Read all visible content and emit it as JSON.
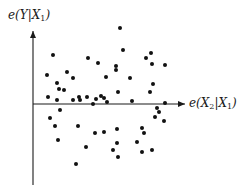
{
  "chart_data": {
    "type": "scatter",
    "title": "",
    "xlabel": "e(X2|X1)",
    "ylabel": "e(Y|X1)",
    "xlabel_parts": {
      "pre": "e(X",
      "sub1": "2",
      "mid": "|X",
      "sub2": "1",
      "post": ")"
    },
    "ylabel_parts": {
      "pre": "e(Y|X",
      "sub1": "1",
      "post": ")"
    },
    "grid": false,
    "ticks": false,
    "legend": null,
    "axes": {
      "origin_px": [
        33,
        104
      ],
      "y_axis_top_px": 30,
      "y_axis_bottom_px": 185,
      "x_axis_right_px": 183,
      "color": "#1a1a1a"
    },
    "point_color": "#111111",
    "point_radius": 2,
    "points_px": [
      [
        53,
        55
      ],
      [
        120,
        28
      ],
      [
        123,
        50
      ],
      [
        47,
        75
      ],
      [
        88,
        58
      ],
      [
        98,
        63
      ],
      [
        67,
        72
      ],
      [
        73,
        78
      ],
      [
        116,
        66
      ],
      [
        57,
        83
      ],
      [
        106,
        77
      ],
      [
        59,
        89
      ],
      [
        64,
        90
      ],
      [
        87,
        97
      ],
      [
        101,
        96
      ],
      [
        57,
        100
      ],
      [
        48,
        97
      ],
      [
        116,
        70
      ],
      [
        107,
        102
      ],
      [
        79,
        97
      ],
      [
        73,
        100
      ],
      [
        152,
        64
      ],
      [
        146,
        58
      ],
      [
        150,
        92
      ],
      [
        153,
        84
      ],
      [
        104,
        98
      ],
      [
        96,
        99
      ],
      [
        118,
        92
      ],
      [
        130,
        78
      ],
      [
        165,
        65
      ],
      [
        151,
        53
      ],
      [
        93,
        104
      ],
      [
        132,
        101
      ],
      [
        165,
        103
      ],
      [
        80,
        100
      ],
      [
        50,
        118
      ],
      [
        60,
        110
      ],
      [
        58,
        140
      ],
      [
        55,
        126
      ],
      [
        78,
        126
      ],
      [
        95,
        133
      ],
      [
        104,
        132
      ],
      [
        86,
        147
      ],
      [
        157,
        108
      ],
      [
        159,
        112
      ],
      [
        155,
        117
      ],
      [
        164,
        121
      ],
      [
        117,
        129
      ],
      [
        142,
        128
      ],
      [
        144,
        133
      ],
      [
        76,
        164
      ],
      [
        117,
        143
      ],
      [
        113,
        150
      ],
      [
        118,
        157
      ],
      [
        142,
        152
      ],
      [
        137,
        142
      ],
      [
        152,
        150
      ]
    ],
    "note": "Residual (added-variable) plot; points given in pixel coordinates relative to the image; no numeric ticks shown."
  }
}
